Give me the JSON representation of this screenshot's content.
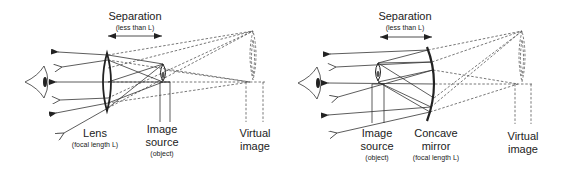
{
  "panels": [
    {
      "id": "lens-magnifier",
      "separation": {
        "title": "Separation",
        "subtitle": "(less than L)"
      },
      "labels": {
        "optic": "Lens",
        "optic_sub": "(focal length L)",
        "source_line1": "Image",
        "source_line2": "source",
        "source_sub": "(object)",
        "virtual_line1": "Virtual",
        "virtual_line2": "image"
      }
    },
    {
      "id": "concave-mirror-magnifier",
      "separation": {
        "title": "Separation",
        "subtitle": "(less than L)"
      },
      "labels": {
        "source_line1": "Image",
        "source_line2": "source",
        "source_sub": "(object)",
        "optic_line1": "Concave",
        "optic_line2": "mirror",
        "optic_sub": "(focal length L)",
        "virtual_line1": "Virtual",
        "virtual_line2": "image"
      }
    }
  ],
  "colors": {
    "line": "#333333",
    "dashed": "#555555",
    "background": "#ffffff"
  }
}
